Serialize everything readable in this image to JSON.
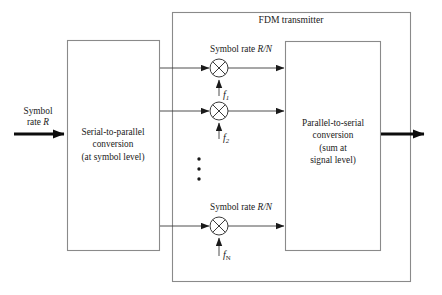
{
  "figure": {
    "outer_box_label": "FDM transmitter",
    "input_label_line1": "Symbol",
    "input_label_line2": "rate R",
    "serial_to_parallel": {
      "line1": "Serial-to-parallel",
      "line2": "conversion",
      "line3": "(at symbol level)"
    },
    "parallel_to_serial": {
      "line1": "Parallel-to-serial",
      "line2": "conversion",
      "line3": "(sum at",
      "line4": "signal level)"
    },
    "branch_rate_label_top": "Symbol rate R/N",
    "branch_rate_label_bottom": "Symbol rate R/N",
    "carriers": [
      {
        "name": "f1",
        "base": "f",
        "subscript": "1"
      },
      {
        "name": "f2",
        "base": "f",
        "subscript": "2"
      },
      {
        "name": "fN",
        "base": "f",
        "subscript": "N"
      }
    ],
    "mixer_symbol": "circled-cross",
    "ellipsis": "vertical-dots",
    "colors": {
      "line": "#7a7a7a",
      "signal": "#1a1a1a",
      "text": "#1a1a1a",
      "background": "#ffffff"
    }
  }
}
